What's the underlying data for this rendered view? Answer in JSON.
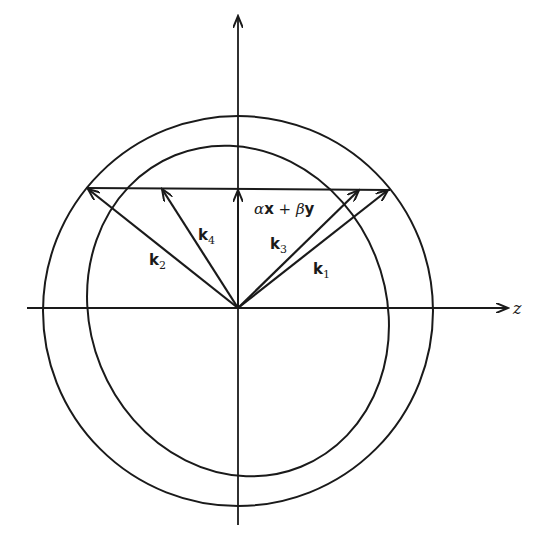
{
  "figure": {
    "axes": {
      "horizontal_label": "z",
      "vertical_label": ""
    },
    "vectors": [
      {
        "name": "k1",
        "label_main": "k",
        "label_sub": "1"
      },
      {
        "name": "k2",
        "label_main": "k",
        "label_sub": "2"
      },
      {
        "name": "k3",
        "label_main": "k",
        "label_sub": "3"
      },
      {
        "name": "k4",
        "label_main": "k",
        "label_sub": "4"
      }
    ],
    "transverse_vector": {
      "alpha": "α",
      "x": "x",
      "plus": " + ",
      "beta": "β",
      "y": "y"
    },
    "colors": {
      "stroke": "#1a1a1a",
      "background": "#ffffff"
    }
  }
}
